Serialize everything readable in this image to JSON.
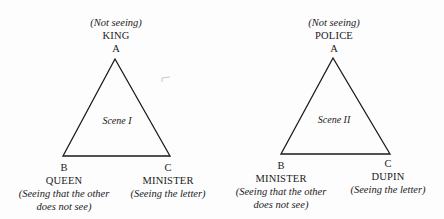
{
  "diagram": {
    "scenes": [
      {
        "title": "Scene I",
        "vertices": {
          "A": {
            "letter": "A",
            "role": "KING",
            "note": "(Not seeing)"
          },
          "B": {
            "letter": "B",
            "role": "QUEEN",
            "note_line1": "(Seeing that the other",
            "note_line2": "does not see)"
          },
          "C": {
            "letter": "C",
            "role": "MINISTER",
            "note": "(Seeing the letter)"
          }
        }
      },
      {
        "title": "Scene II",
        "vertices": {
          "A": {
            "letter": "A",
            "role": "POLICE",
            "note": "(Not seeing)"
          },
          "B": {
            "letter": "B",
            "role": "MINISTER",
            "note_line1": "(Seeing that the other",
            "note_line2": "does not see)"
          },
          "C": {
            "letter": "C",
            "role": "DUPIN",
            "note": "(Seeing the letter)"
          }
        }
      }
    ],
    "colors": {
      "line": "#1a1a1a",
      "background": "#fdfdfd"
    }
  }
}
